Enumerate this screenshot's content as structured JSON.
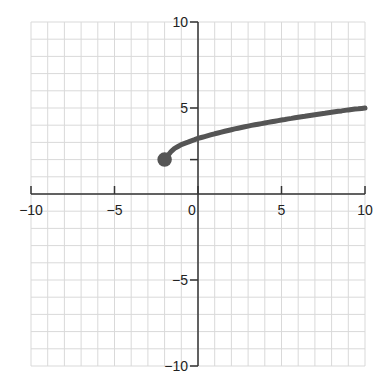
{
  "chart_data": {
    "type": "line",
    "title": "",
    "xlabel": "",
    "ylabel": "",
    "xlim": [
      -10,
      10
    ],
    "ylim": [
      -10,
      10
    ],
    "grid": true,
    "grid_step": 1,
    "x_ticks": [
      -10,
      -5,
      0,
      5,
      10
    ],
    "y_ticks": [
      10,
      5,
      -5,
      -10
    ],
    "x_tick_labels": [
      "−10",
      "−5",
      "0",
      "5",
      "10"
    ],
    "y_tick_labels": [
      "10",
      "5",
      "−5",
      "−10"
    ],
    "minor_tick_y": [
      2
    ],
    "series": [
      {
        "name": "curve",
        "color": "#555555",
        "start_point": {
          "x": -2,
          "y": 2,
          "closed": true
        },
        "x": [
          -2,
          -1.5,
          -1,
          0,
          1,
          2,
          3,
          4,
          5,
          6,
          7,
          8,
          9,
          10
        ],
        "y": [
          2,
          2.6,
          2.87,
          3.23,
          3.5,
          3.74,
          3.95,
          4.13,
          4.3,
          4.46,
          4.61,
          4.75,
          4.89,
          5.0
        ]
      }
    ],
    "legend": null
  },
  "colors": {
    "grid": "#d9d9d9",
    "axis": "#333333",
    "curve": "#555555"
  }
}
